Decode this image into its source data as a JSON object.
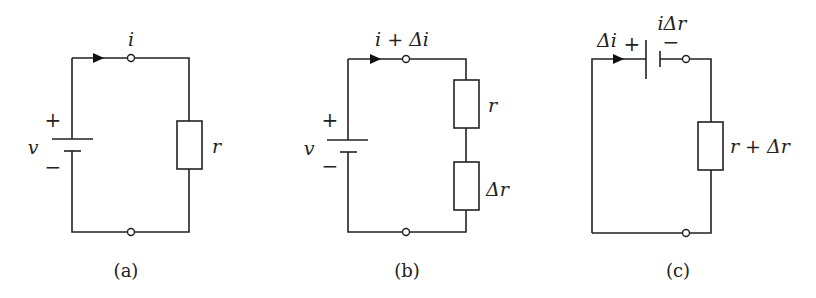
{
  "figure": {
    "panels": [
      {
        "id": "a",
        "caption": "(a)",
        "current_label": "i",
        "source": {
          "label": "v",
          "plus": "+",
          "minus": "−"
        },
        "resistors": [
          {
            "label": "r"
          }
        ]
      },
      {
        "id": "b",
        "caption": "(b)",
        "current_label": "i + Δi",
        "source": {
          "label": "v",
          "plus": "+",
          "minus": "−"
        },
        "resistors": [
          {
            "label": "r"
          },
          {
            "label": "Δr"
          }
        ]
      },
      {
        "id": "c",
        "caption": "(c)",
        "current_label": "Δi",
        "source": {
          "label": "iΔr",
          "plus": "+",
          "minus": "−"
        },
        "resistors": [
          {
            "label": "r + Δr"
          }
        ]
      }
    ]
  }
}
